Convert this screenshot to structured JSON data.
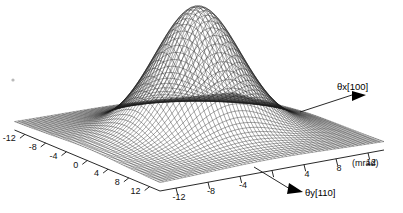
{
  "figure": {
    "kind": "surface-plot",
    "background_color": "#ffffff",
    "mesh_color": "#1a1a1a",
    "speck_label": "·"
  },
  "chart_data": {
    "type": "surface",
    "title": "",
    "subtitle": "",
    "xlabel": "θx[100]",
    "ylabel": "θy[110]",
    "zlabel": "",
    "units": "(mrad)",
    "xlim": [
      -14,
      14
    ],
    "ylim": [
      -14,
      14
    ],
    "zlim": [
      0,
      1
    ],
    "grid": false,
    "legend": false,
    "legend_position": "none",
    "projection": {
      "azimuth_deg": 45,
      "elevation_deg": 28
    },
    "x_axis": {
      "name": "θx[100]",
      "tick_labels": [
        "-12",
        "-8",
        "-4",
        "0",
        "4",
        "8",
        "12"
      ],
      "tick_values": [
        -12,
        -8,
        -4,
        0,
        4,
        8,
        12
      ],
      "unit_label": "(mrad)",
      "axis_label_text": "θx[100]",
      "arrow": "filled-triangle-right"
    },
    "y_axis": {
      "name": "θy[110]",
      "tick_labels": [
        "-12",
        "-8",
        "-4",
        "0",
        "4",
        "8",
        "12"
      ],
      "tick_values": [
        -12,
        -8,
        -4,
        0,
        4,
        8,
        12
      ],
      "unit_label": "(mrad)",
      "axis_label_text": "θy[110]",
      "arrow": "filled-triangle-left"
    },
    "surface_model": {
      "description": "axially-peaked Gaussian-like angular yield distribution",
      "peak_height": 1.0,
      "peak_x": 0.0,
      "peak_y": 0.0,
      "sigma_x": 4.2,
      "sigma_y": 4.6,
      "pedestal": 0.06,
      "shoulder_amplitude": 0.1,
      "shoulder_sigma": 9.5,
      "grid_n": 61
    },
    "peak_value": 1.0,
    "baseline_value": 0.06
  },
  "axis_ticks_left": {
    "label": "θx left base edge ticks",
    "values": [
      "-12",
      "-8",
      "-4",
      "0",
      "4",
      "8",
      "12"
    ]
  },
  "axis_ticks_right": {
    "label": "θy right base edge ticks",
    "values": [
      "-12",
      "-8",
      "-4",
      "4",
      "8",
      "12"
    ],
    "trailing_unit": "12 (mrad)"
  },
  "annotations": [
    {
      "name": "theta-x-label",
      "text": "θx[100]"
    },
    {
      "name": "theta-y-label",
      "text": "θy[110]"
    },
    {
      "name": "unit-label",
      "text": "(mrad)"
    }
  ]
}
